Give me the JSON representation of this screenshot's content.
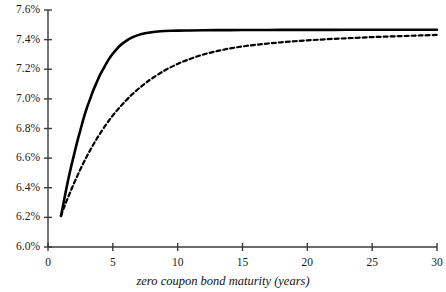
{
  "chart_data": {
    "type": "line",
    "title": "",
    "subtitle": "",
    "xlabel": "zero coupon bond maturity (years)",
    "ylabel": "",
    "xlim": [
      0,
      30
    ],
    "ylim": [
      6.0,
      7.6
    ],
    "grid": false,
    "legend": "none",
    "x_ticks": [
      0,
      5,
      10,
      15,
      20,
      25,
      30
    ],
    "x_tick_labels": [
      "0",
      "5",
      "10",
      "15",
      "20",
      "25",
      "30"
    ],
    "y_ticks": [
      6.0,
      6.2,
      6.4,
      6.6,
      6.8,
      7.0,
      7.2,
      7.4,
      7.6
    ],
    "y_tick_labels": [
      "6.0%",
      "6.2%",
      "6.4%",
      "6.6%",
      "6.8%",
      "7.0%",
      "7.2%",
      "7.4%",
      "7.6%"
    ],
    "series": [
      {
        "name": "solid-curve",
        "style": "solid",
        "color": "#000000",
        "width": 2.6,
        "x": [
          1,
          1.25,
          1.5,
          1.75,
          2,
          2.25,
          2.5,
          2.75,
          3,
          3.25,
          3.5,
          3.75,
          4,
          4.25,
          4.5,
          4.75,
          5,
          5.5,
          6,
          6.5,
          7,
          7.5,
          8,
          8.5,
          9,
          9.5,
          10,
          11,
          12,
          13,
          14,
          15,
          16,
          17,
          18,
          19,
          20,
          22,
          24,
          26,
          28,
          30
        ],
        "y": [
          6.21,
          6.32,
          6.43,
          6.53,
          6.62,
          6.71,
          6.79,
          6.87,
          6.94,
          7.0,
          7.06,
          7.11,
          7.16,
          7.2,
          7.24,
          7.275,
          7.305,
          7.355,
          7.39,
          7.415,
          7.432,
          7.443,
          7.45,
          7.455,
          7.458,
          7.46,
          7.461,
          7.462,
          7.463,
          7.464,
          7.464,
          7.465,
          7.465,
          7.465,
          7.466,
          7.466,
          7.466,
          7.466,
          7.467,
          7.467,
          7.467,
          7.467
        ]
      },
      {
        "name": "dashed-curve",
        "style": "dashed",
        "color": "#000000",
        "width": 2.2,
        "dash_pattern": "4 3",
        "x": [
          1,
          1.25,
          1.5,
          1.75,
          2,
          2.25,
          2.5,
          2.75,
          3,
          3.25,
          3.5,
          3.75,
          4,
          4.5,
          5,
          5.5,
          6,
          6.5,
          7,
          7.5,
          8,
          9,
          10,
          11,
          12,
          13,
          14,
          15,
          16,
          17,
          18,
          19,
          20,
          21,
          22,
          23,
          24,
          25,
          26,
          27,
          28,
          29,
          30
        ],
        "y": [
          6.21,
          6.27,
          6.325,
          6.378,
          6.43,
          6.478,
          6.525,
          6.57,
          6.613,
          6.653,
          6.692,
          6.729,
          6.764,
          6.829,
          6.888,
          6.94,
          6.988,
          7.031,
          7.07,
          7.105,
          7.137,
          7.192,
          7.236,
          7.271,
          7.3,
          7.322,
          7.34,
          7.354,
          7.365,
          7.374,
          7.382,
          7.389,
          7.395,
          7.4,
          7.405,
          7.409,
          7.413,
          7.417,
          7.42,
          7.423,
          7.426,
          7.429,
          7.432
        ]
      }
    ]
  },
  "axes": {
    "axis_color": "#3a3a3a",
    "tick_color": "#3a3a3a",
    "text_color": "#1a1a1a"
  }
}
